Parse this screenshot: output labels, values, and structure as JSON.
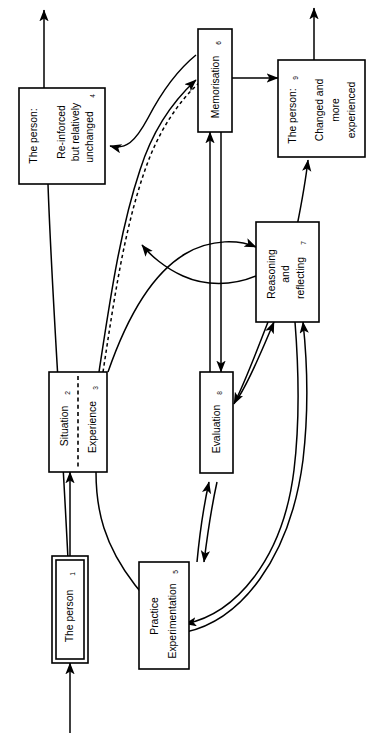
{
  "figure": {
    "kind": "flow-diagram",
    "orientation": "rotated-90-clockwise",
    "background": "#ffffff",
    "line_color": "#000000"
  },
  "nodes": {
    "person_start": {
      "id": "1",
      "lines": [
        "The person"
      ],
      "index": "1",
      "style": "double-border"
    },
    "situation": {
      "id": "2",
      "lines": [
        "Situation"
      ],
      "index": "2",
      "style": "split-left"
    },
    "experience": {
      "id": "3",
      "lines": [
        "Experience"
      ],
      "index": "3",
      "style": "split-right"
    },
    "person_unchanged": {
      "id": "4",
      "lines": [
        "The person:",
        "Re-inforced",
        "but relatively",
        "unchanged"
      ],
      "title": "The person:",
      "body": [
        "Re-inforced",
        "but relatively",
        "unchanged"
      ],
      "index": "4",
      "style": "single-border"
    },
    "practice": {
      "id": "5",
      "lines": [
        "Practice",
        "Experimentation"
      ],
      "index": "5",
      "style": "single-border"
    },
    "memorisation": {
      "id": "6",
      "lines": [
        "Memorisation"
      ],
      "index": "6",
      "style": "single-border"
    },
    "reasoning": {
      "id": "7",
      "lines": [
        "Reasoning",
        "and",
        "reflecting"
      ],
      "index": "7",
      "style": "single-border"
    },
    "evaluation": {
      "id": "8",
      "lines": [
        "Evaluation"
      ],
      "index": "8",
      "style": "single-border"
    },
    "person_changed": {
      "id": "9",
      "lines": [
        "The person:",
        "Changed and",
        "more",
        "experienced"
      ],
      "title": "The person:",
      "body": [
        "Changed and",
        "more",
        "experienced"
      ],
      "index": "9",
      "style": "single-border"
    }
  },
  "edges": [
    {
      "name": "inflow-to-person-start",
      "from": "",
      "to": "person_start",
      "style": "solid",
      "arrow": true
    },
    {
      "name": "person-start-to-situation",
      "from": "person_start",
      "to": "situation",
      "style": "solid",
      "arrow": true
    },
    {
      "name": "experience-to-practice",
      "from": "experience",
      "to": "practice",
      "style": "solid",
      "arrow": true
    },
    {
      "name": "experience-to-memorisation",
      "from": "experience",
      "to": "memorisation",
      "style": "solid",
      "arrow": true
    },
    {
      "name": "memorisation-to-experience",
      "from": "memorisation",
      "to": "experience",
      "style": "solid",
      "arrow": true
    },
    {
      "name": "experience-to-memorisation-dashed",
      "from": "experience",
      "to": "memorisation",
      "style": "dashed",
      "arrow": false
    },
    {
      "name": "experience-to-reasoning",
      "from": "experience",
      "to": "reasoning",
      "style": "solid",
      "arrow": true
    },
    {
      "name": "reasoning-to-experience",
      "from": "reasoning",
      "to": "experience",
      "style": "solid",
      "arrow": true
    },
    {
      "name": "person-unchanged-outflow",
      "from": "person_unchanged",
      "to": "",
      "style": "solid",
      "arrow": true
    },
    {
      "name": "person-unchanged-to-start",
      "from": "person_unchanged",
      "to": "person_start",
      "style": "solid",
      "arrow": true
    },
    {
      "name": "memorisation-to-person-changed",
      "from": "memorisation",
      "to": "person_changed",
      "style": "solid",
      "arrow": true
    },
    {
      "name": "reasoning-to-person-changed",
      "from": "reasoning",
      "to": "person_changed",
      "style": "solid",
      "arrow": true
    },
    {
      "name": "person-changed-outflow",
      "from": "person_changed",
      "to": "",
      "style": "solid",
      "arrow": true
    },
    {
      "name": "practice-to-evaluation",
      "from": "practice",
      "to": "evaluation",
      "style": "solid",
      "arrow": true
    },
    {
      "name": "evaluation-to-practice",
      "from": "evaluation",
      "to": "practice",
      "style": "solid",
      "arrow": true
    },
    {
      "name": "evaluation-to-memorisation",
      "from": "evaluation",
      "to": "memorisation",
      "style": "solid",
      "arrow": true
    },
    {
      "name": "memorisation-to-evaluation",
      "from": "memorisation",
      "to": "evaluation",
      "style": "solid",
      "arrow": true
    },
    {
      "name": "practice-to-reasoning",
      "from": "practice",
      "to": "reasoning",
      "style": "solid",
      "arrow": true
    },
    {
      "name": "reasoning-to-practice",
      "from": "reasoning",
      "to": "practice",
      "style": "solid",
      "arrow": true
    },
    {
      "name": "evaluation-to-reasoning",
      "from": "evaluation",
      "to": "reasoning",
      "style": "solid",
      "arrow": true
    },
    {
      "name": "reasoning-to-evaluation",
      "from": "reasoning",
      "to": "evaluation",
      "style": "solid",
      "arrow": true
    }
  ]
}
